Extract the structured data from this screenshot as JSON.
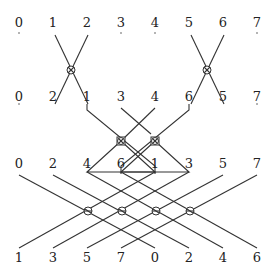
{
  "diagram": {
    "type": "butterfly-permutation-network",
    "rows": [
      {
        "name": "row-1",
        "labels": [
          "0",
          "1",
          "2",
          "3",
          "4",
          "5",
          "6",
          "7"
        ],
        "y": 22
      },
      {
        "name": "row-2",
        "labels": [
          "0",
          "2",
          "1",
          "3",
          "4",
          "6",
          "5",
          "7"
        ],
        "y": 98
      },
      {
        "name": "row-3",
        "labels": [
          "0",
          "2",
          "4",
          "6",
          "1",
          "3",
          "5",
          "7"
        ],
        "y": 165
      },
      {
        "name": "row-4",
        "labels": [
          "1",
          "3",
          "5",
          "7",
          "0",
          "2",
          "4",
          "6"
        ],
        "y": 255
      }
    ],
    "column_x": [
      19,
      53,
      87,
      121,
      155,
      189,
      223,
      257
    ],
    "switch_nodes": [
      {
        "x": 70,
        "y": 70,
        "style": "otimes"
      },
      {
        "x": 206,
        "y": 70,
        "style": "otimes"
      },
      {
        "x": 121,
        "y": 141,
        "style": "boxed-otimes"
      },
      {
        "x": 155,
        "y": 141,
        "style": "boxed-otimes"
      },
      {
        "x": 88,
        "y": 211,
        "style": "otimes"
      },
      {
        "x": 122,
        "y": 211,
        "style": "otimes"
      },
      {
        "x": 156,
        "y": 211,
        "style": "otimes"
      },
      {
        "x": 190,
        "y": 211,
        "style": "otimes"
      }
    ],
    "line_color": "#333333",
    "background": "#ffffff"
  }
}
